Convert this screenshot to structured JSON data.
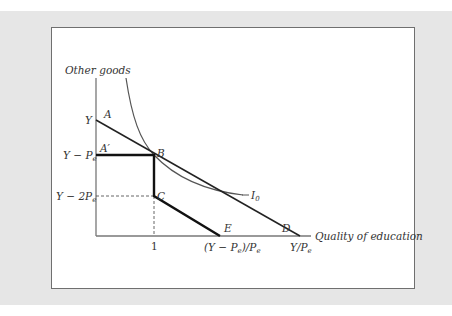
{
  "diagram": {
    "y_axis_label": "Other goods",
    "x_axis_label": "Quality of education",
    "y_ticks": [
      {
        "text": "Y"
      },
      {
        "text": "Y − P",
        "sub": "e"
      },
      {
        "text": "Y − 2P",
        "sub": "e"
      }
    ],
    "x_ticks": [
      {
        "text": "1"
      },
      {
        "text": "(Y − P",
        "sub": "e",
        "tail": ")/P",
        "sub2": "e"
      },
      {
        "text": "Y/P",
        "sub": "e"
      }
    ],
    "points": {
      "A": "A",
      "A_prime": "A′",
      "B": "B",
      "C": "C",
      "D": "D",
      "E": "E"
    },
    "indifference_curve": {
      "label": "I",
      "sub": "0"
    },
    "colors": {
      "background": "#e6e6e6",
      "frame": "#ffffff",
      "frame_border": "#6f6f6f",
      "axis": "#777777",
      "budget_line": "#222222",
      "curve": "#555555"
    }
  }
}
